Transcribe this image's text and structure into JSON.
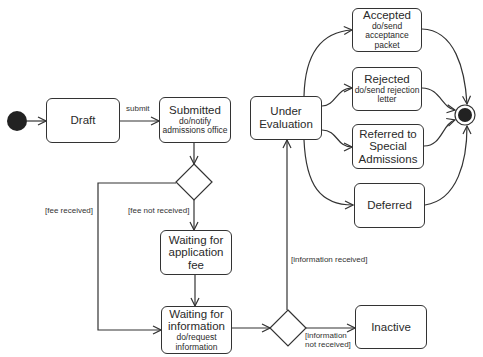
{
  "diagram": {
    "type": "uml-state-machine",
    "title_fragment": "",
    "colors": {
      "stroke": "#333333",
      "fill": "#ffffff",
      "node": "#222222"
    },
    "initial_node": {
      "label": "initial"
    },
    "final_node": {
      "label": "final"
    },
    "states": {
      "draft": {
        "name": "Draft",
        "action": ""
      },
      "submitted": {
        "name": "Submitted",
        "action": "do/notify admissions office"
      },
      "waiting_fee": {
        "name": "Waiting for application fee",
        "action": ""
      },
      "waiting_info": {
        "name": "Waiting for information",
        "action": "do/request information"
      },
      "under_evaluation": {
        "name": "Under Evaluation",
        "action": ""
      },
      "accepted": {
        "name": "Accepted",
        "action": "do/send acceptance packet"
      },
      "rejected": {
        "name": "Rejected",
        "action": "do/send rejection letter"
      },
      "referred": {
        "name": "Referred to Special Admissions",
        "action": ""
      },
      "deferred": {
        "name": "Deferred",
        "action": ""
      },
      "inactive": {
        "name": "Inactive",
        "action": ""
      }
    },
    "transitions": {
      "submit": "submit",
      "fee_received": "[fee received]",
      "fee_not_received": "[fee not received]",
      "info_received": "[information received]",
      "info_not_received_1": "[information",
      "info_not_received_2": "not received]"
    }
  }
}
